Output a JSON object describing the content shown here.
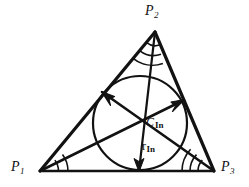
{
  "figure": {
    "type": "geometry-diagram",
    "background_color": "#ffffff",
    "stroke_color": "#121212",
    "canvas": {
      "width": 249,
      "height": 187
    },
    "vertices": [
      {
        "id": "P1",
        "label_main": "P",
        "label_sub": "1",
        "x": 40,
        "y": 171,
        "label_x": 11,
        "label_y": 160
      },
      {
        "id": "P2",
        "label_main": "P",
        "label_sub": "2",
        "x": 155,
        "y": 32,
        "label_x": 145,
        "label_y": 5
      },
      {
        "id": "P3",
        "label_main": "P",
        "label_sub": "3",
        "x": 214,
        "y": 171,
        "label_x": 221,
        "label_y": 160
      }
    ],
    "incenter": {
      "id": "C_In",
      "label_main": "C",
      "label_sub": "In",
      "x": 140,
      "y": 123,
      "label_x": 146,
      "label_y": 117
    },
    "inradius": {
      "id": "r_In",
      "label_main": "r",
      "label_sub": "In",
      "value_px": 47,
      "label_x": 141,
      "label_y": 146,
      "foot_x": 139,
      "foot_y": 171
    },
    "incircle": {
      "cx": 140,
      "cy": 123,
      "r": 47
    },
    "angle_arc_counts": {
      "P1": 2,
      "P2": 3,
      "P3": 3
    },
    "bisector_arrows": [
      {
        "from": "C_In",
        "to": "P1_side_P1P2_touchpoint",
        "tip_x": 102,
        "tip_y": 92
      },
      {
        "from": "C_In",
        "to": "P3_side_P2P3_touchpoint",
        "tip_x": 184,
        "tip_y": 100
      },
      {
        "from": "C_In",
        "to": "base_touchpoint",
        "tip_x": 139,
        "tip_y": 170
      }
    ]
  }
}
